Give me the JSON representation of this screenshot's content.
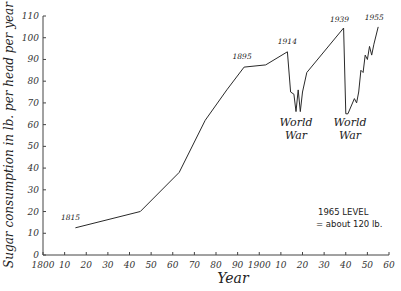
{
  "chart_data": {
    "type": "line",
    "title": "",
    "xlabel": "Year",
    "ylabel": "Sugar consumption in lb. per head per year",
    "xlim": [
      1800,
      1960
    ],
    "ylim": [
      0,
      110
    ],
    "grid": false,
    "legend": null,
    "x_ticks": [
      1800,
      1810,
      1820,
      1830,
      1840,
      1850,
      1860,
      1870,
      1880,
      1890,
      1900,
      1910,
      1920,
      1930,
      1940,
      1950,
      1960
    ],
    "x_tick_labels": [
      "1800",
      "10",
      "20",
      "30",
      "40",
      "50",
      "60",
      "70",
      "80",
      "90",
      "1900",
      "10",
      "20",
      "30",
      "40",
      "50",
      "60"
    ],
    "y_ticks": [
      0,
      10,
      20,
      30,
      40,
      50,
      60,
      70,
      80,
      90,
      100,
      110
    ],
    "y_tick_labels": [
      "0",
      "10",
      "20",
      "30",
      "40",
      "50",
      "60",
      "70",
      "80",
      "90",
      "100",
      "110"
    ],
    "series": [
      {
        "name": "Sugar consumption",
        "x": [
          1815,
          1845,
          1863,
          1875,
          1885,
          1893,
          1903,
          1913,
          1914.5,
          1916,
          1917,
          1918,
          1919,
          1920,
          1922,
          1939,
          1940,
          1941,
          1944,
          1945,
          1946,
          1947,
          1948,
          1949,
          1950,
          1951,
          1952,
          1953,
          1955
        ],
        "values": [
          12.5,
          20,
          38,
          62,
          76,
          86.5,
          87.5,
          93.5,
          75,
          74,
          66,
          76,
          66,
          75,
          84,
          104.5,
          65,
          65,
          72,
          70,
          75,
          85,
          84,
          92,
          90,
          96,
          92,
          97,
          105
        ]
      }
    ],
    "annotations": [
      {
        "text": "1815",
        "x": 1815,
        "y": 12.5
      },
      {
        "text": "1895",
        "x": 1893,
        "y": 86.5
      },
      {
        "text": "1914",
        "x": 1913,
        "y": 93.5
      },
      {
        "text": "1939",
        "x": 1939,
        "y": 104.5
      },
      {
        "text": "1955",
        "x": 1955,
        "y": 105
      },
      {
        "text": "World War",
        "x": 1918,
        "y": 60
      },
      {
        "text": "World War",
        "x": 1942,
        "y": 60
      },
      {
        "text": "1965 LEVEL",
        "x": 1938,
        "y": 22
      },
      {
        "text": "= about 120 lb.",
        "x": 1938,
        "y": 16
      }
    ]
  },
  "labels": {
    "ylabel": "Sugar consumption in lb. per head per year",
    "xlabel": "Year",
    "note_line1": "1965 LEVEL",
    "note_line2": "= about 120 lb.",
    "war1": [
      "World",
      "War"
    ],
    "war2": [
      "World",
      "War"
    ],
    "point_labels": [
      "1815",
      "1895",
      "1914",
      "1939",
      "1955"
    ]
  },
  "style": {
    "line_color": "#2a2a2a",
    "axis_color": "#444444"
  }
}
